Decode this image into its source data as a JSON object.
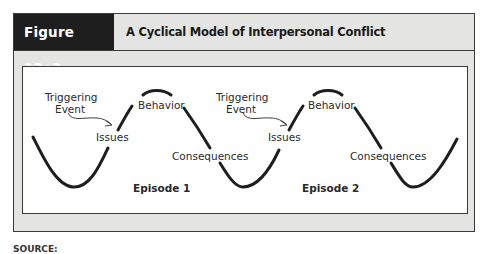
{
  "figure": {
    "label": "Figure 12•2",
    "title": "A Cyclical Model of Interpersonal Conflict"
  },
  "diagram": {
    "episodes": [
      {
        "name": "Episode 1",
        "labels": {
          "trigger_line1": "Triggering",
          "trigger_line2": "Event",
          "issues": "Issues",
          "behavior": "Behavior",
          "consequences": "Consequences"
        }
      },
      {
        "name": "Episode 2",
        "labels": {
          "trigger_line1": "Triggering",
          "trigger_line2": "Event",
          "issues": "Issues",
          "behavior": "Behavior",
          "consequences": "Consequences"
        }
      }
    ],
    "colors": {
      "line": "#1e1e1e",
      "header_dark": "#1e1e1e",
      "frame_bg": "#e4e4e2"
    }
  },
  "footer": {
    "source_text": "SOURCE:"
  }
}
